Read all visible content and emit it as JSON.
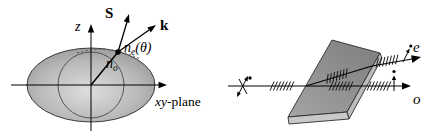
{
  "figure": {
    "left": {
      "z_axis_label": "z",
      "poynting_vector_label": "S",
      "wave_vector_label": "k",
      "extraordinary_index_label": {
        "base": "n",
        "sub": "e",
        "args": "(θ)"
      },
      "ordinary_index_label": {
        "base": "n",
        "sub": "o"
      },
      "plane_label": {
        "italic": "xy",
        "rest": "-plane"
      }
    },
    "right": {
      "extraordinary_ray_label": "e",
      "ordinary_ray_label": "o"
    }
  },
  "colors": {
    "background": "#ffffff",
    "line": "#000000",
    "ellipsoid_center": "#dedede",
    "ellipsoid_mid": "#b9b9b9",
    "ellipsoid_edge": "#8b8b8b",
    "slab_top_light": "#a4a4a4",
    "slab_top_dark": "#7d7d7d",
    "slab_front": "#c9c9c9",
    "slab_side": "#bcbcbc"
  }
}
